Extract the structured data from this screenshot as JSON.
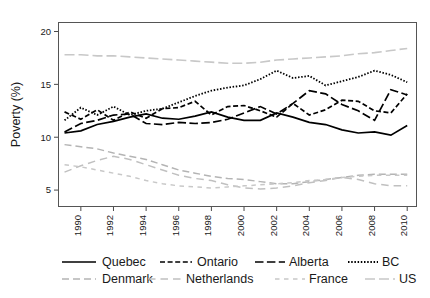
{
  "figure": {
    "clipped_top_text": "",
    "background": "#ffffff"
  },
  "chart_data": {
    "type": "line",
    "title": "",
    "xlabel": "",
    "ylabel": "Poverty (%)",
    "xlim": [
      1988.6,
      2010.6
    ],
    "ylim": [
      3.4,
      20.9
    ],
    "xticks": [
      1990,
      1992,
      1994,
      1996,
      1998,
      2000,
      2002,
      2004,
      2006,
      2008,
      2010
    ],
    "xticklabels": [
      "1990",
      "1992",
      "1994",
      "1996",
      "1998",
      "2000",
      "2002",
      "2004",
      "2006",
      "2008",
      "2010"
    ],
    "yticks": [
      5,
      10,
      15,
      20
    ],
    "yticklabels": [
      "5",
      "10",
      "15",
      "20"
    ],
    "grid": false,
    "legend_position": "below",
    "x": [
      1989,
      1990,
      1991,
      1992,
      1993,
      1994,
      1995,
      1996,
      1997,
      1998,
      1999,
      2000,
      2001,
      2002,
      2003,
      2004,
      2005,
      2006,
      2007,
      2008,
      2009,
      2010
    ],
    "series": [
      {
        "name": "Quebec",
        "color": "#000000",
        "dash": "solid",
        "values": [
          10.4,
          10.6,
          11.2,
          11.5,
          11.9,
          12.2,
          11.8,
          11.7,
          12.0,
          12.4,
          11.9,
          11.6,
          11.6,
          12.3,
          11.9,
          11.4,
          11.2,
          10.7,
          10.4,
          10.5,
          10.2,
          11.1
        ]
      },
      {
        "name": "Ontario",
        "color": "#000000",
        "dash": "dashed",
        "values": [
          12.4,
          11.7,
          12.6,
          11.6,
          12.4,
          11.8,
          12.7,
          12.8,
          13.4,
          12.1,
          12.9,
          13.0,
          12.5,
          11.9,
          13.2,
          12.1,
          12.6,
          13.5,
          13.4,
          12.5,
          12.3,
          14.1
        ]
      },
      {
        "name": "Alberta",
        "color": "#000000",
        "dash": "longdash",
        "values": [
          10.5,
          11.3,
          11.6,
          12.1,
          12.2,
          11.3,
          11.2,
          11.4,
          11.3,
          11.4,
          11.7,
          12.3,
          12.9,
          12.2,
          13.2,
          14.4,
          14.1,
          13.1,
          12.5,
          11.6,
          14.5,
          14.0
        ]
      },
      {
        "name": "BC",
        "color": "#000000",
        "dash": "dotted",
        "values": [
          11.6,
          12.8,
          12.1,
          12.9,
          12.1,
          12.5,
          12.7,
          13.3,
          13.9,
          14.4,
          14.7,
          14.9,
          15.5,
          16.3,
          15.6,
          15.8,
          14.9,
          15.3,
          15.7,
          16.3,
          15.9,
          15.2
        ]
      },
      {
        "name": "Denmark",
        "color": "#b4b4b4",
        "dash": "graydash",
        "values": [
          9.3,
          9.1,
          8.9,
          8.5,
          8.2,
          7.9,
          7.4,
          6.9,
          6.6,
          6.3,
          6.1,
          6.0,
          5.8,
          5.6,
          5.6,
          5.8,
          6.0,
          6.2,
          6.4,
          6.5,
          6.5,
          6.5
        ]
      },
      {
        "name": "Netherlands",
        "color": "#c0c0c0",
        "dash": "graydash2",
        "values": [
          6.7,
          7.3,
          7.8,
          8.2,
          7.9,
          7.4,
          6.9,
          6.4,
          6.1,
          5.9,
          5.5,
          5.2,
          5.1,
          5.2,
          5.4,
          5.7,
          5.9,
          6.2,
          6.0,
          5.6,
          5.4,
          5.4
        ]
      },
      {
        "name": "France",
        "color": "#c8c8c8",
        "dash": "graydash3",
        "values": [
          7.4,
          7.2,
          6.9,
          6.6,
          6.3,
          5.9,
          5.6,
          5.4,
          5.3,
          5.2,
          5.3,
          5.4,
          5.5,
          5.6,
          5.7,
          5.9,
          6.0,
          6.2,
          6.3,
          6.4,
          6.4,
          6.4
        ]
      },
      {
        "name": "US",
        "color": "#c8c8c8",
        "dash": "graylong",
        "values": [
          17.8,
          17.8,
          17.7,
          17.7,
          17.6,
          17.5,
          17.4,
          17.3,
          17.2,
          17.1,
          17.0,
          17.0,
          17.1,
          17.3,
          17.4,
          17.5,
          17.6,
          17.7,
          17.9,
          18.0,
          18.2,
          18.4
        ]
      }
    ]
  },
  "legend": {
    "rows": [
      [
        {
          "label": "Quebec",
          "dash": "solid",
          "color": "#000000"
        },
        {
          "label": "Ontario",
          "dash": "dashed",
          "color": "#000000"
        },
        {
          "label": "Alberta",
          "dash": "longdash",
          "color": "#000000"
        },
        {
          "label": "BC",
          "dash": "dotted",
          "color": "#000000"
        }
      ],
      [
        {
          "label": "Denmark",
          "dash": "graydash",
          "color": "#b4b4b4"
        },
        {
          "label": "Netherlands",
          "dash": "graydash2",
          "color": "#c0c0c0"
        },
        {
          "label": "France",
          "dash": "graydash3",
          "color": "#c8c8c8"
        },
        {
          "label": "US",
          "dash": "graylong",
          "color": "#c8c8c8"
        }
      ]
    ]
  }
}
